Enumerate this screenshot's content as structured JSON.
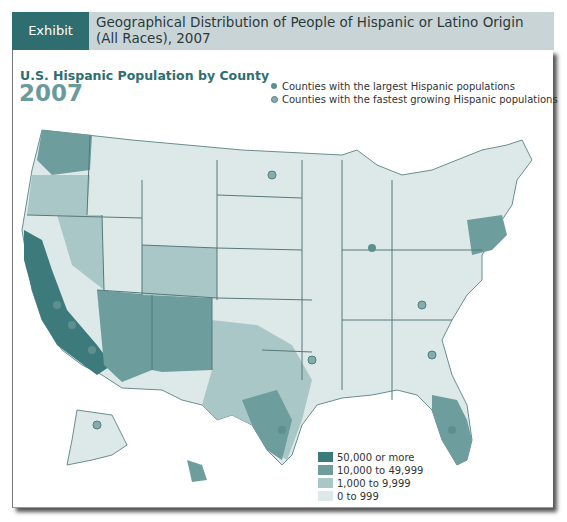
{
  "header": {
    "exhibit_label": "Exhibit 7.13",
    "title": "Geographical Distribution of People of Hispanic or Latino Origin (All Races), 2007"
  },
  "map": {
    "title": "U.S. Hispanic Population by County",
    "year": "2007",
    "marker_legend": [
      {
        "label": "Counties with the largest Hispanic populations",
        "style": "solid"
      },
      {
        "label": "Counties with the fastest growing Hispanic populations",
        "style": "ring"
      }
    ],
    "scale_legend": [
      {
        "label": "50,000 or more",
        "color": "#3d7a7c"
      },
      {
        "label": "10,000 to 49,999",
        "color": "#6e9d9e"
      },
      {
        "label": "1,000 to 9,999",
        "color": "#a9c7c7"
      },
      {
        "label": "0 to 999",
        "color": "#dde9e8"
      }
    ],
    "colors": {
      "accent": "#2f6e70",
      "header_bg": "#c9d4d6",
      "state_border": "#55797a"
    }
  }
}
